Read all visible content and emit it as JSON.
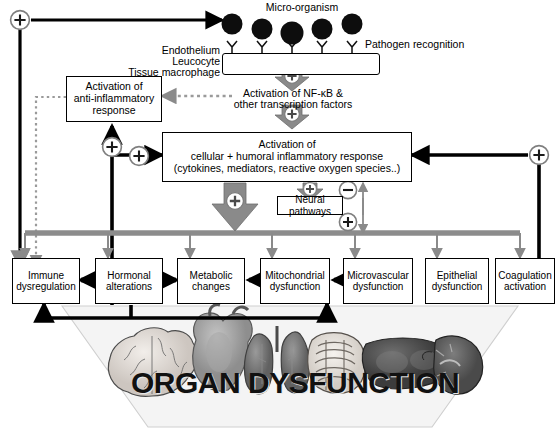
{
  "diagram": {
    "colors": {
      "black": "#000000",
      "gray_bar": "#8c8c8c",
      "gray_arrow": "#8a8a8a",
      "light_gray": "#b5b5b5",
      "funnel_fill": "#f2f2f2",
      "funnel_stroke": "#c9c9c9",
      "white": "#ffffff"
    },
    "top": {
      "micro_organism_label": "Micro-organism",
      "pathogen_recognition_label": "Pathogen recognition",
      "cell_layer_labels": [
        "Endothelium",
        "Leucocyte",
        "Tissue macrophage"
      ],
      "micro_organism_count": 5,
      "receptor_count": 5
    },
    "nodes": {
      "nfkb": {
        "line1": "Activation of NF-κB &",
        "line2": "other transcription factors"
      },
      "anti_inflammatory": {
        "line1": "Activation of",
        "line2": "anti-inflammatory",
        "line3": "response"
      },
      "inflammatory": {
        "line1": "Activation of",
        "line2": "cellular + humoral inflammatory response",
        "line3": "(cytokines, mediators, reactive oxygen species..)"
      },
      "neural": {
        "label": "Neural pathways"
      }
    },
    "outcome_boxes": [
      {
        "id": "immune",
        "line1": "Immune",
        "line2": "dysregulation"
      },
      {
        "id": "hormonal",
        "line1": "Hormonal",
        "line2": "alterations"
      },
      {
        "id": "metabolic",
        "line1": "Metabolic",
        "line2": "changes"
      },
      {
        "id": "mitochondrial",
        "line1": "Mitochondrial",
        "line2": "dysfunction"
      },
      {
        "id": "microvascular",
        "line1": "Microvascular",
        "line2": "dysfunction"
      },
      {
        "id": "epithelial",
        "line1": "Epithelial",
        "line2": "dysfunction"
      },
      {
        "id": "coagulation",
        "line1": "Coagulation",
        "line2": "activation"
      }
    ],
    "bottom": {
      "organ_dysfunction_label": "ORGAN DYSFUNCTION",
      "organs": [
        "brain",
        "heart",
        "lungs",
        "intestine",
        "liver",
        "kidney"
      ]
    },
    "signs": {
      "plus": "+",
      "minus": "−",
      "plus_circle_count": 6,
      "plus_block_arrow_count": 4,
      "minus_circle_count": 1
    }
  }
}
